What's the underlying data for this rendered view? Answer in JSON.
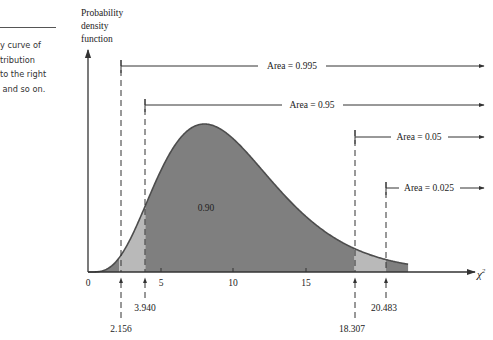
{
  "caption": {
    "lines": [
      "y curve of",
      "tribution",
      "to the right",
      " and so on."
    ]
  },
  "chart_data": {
    "type": "area",
    "title": "",
    "ylabel": "Probability density function",
    "xlabel": "χ²",
    "ylabel_lines": [
      "Probability",
      "density",
      "function"
    ],
    "xlabel_text": "χ",
    "xlabel_sup": "2",
    "x_ticks": [
      0,
      5,
      10,
      15
    ],
    "x_tick_labels": [
      "0",
      "5",
      "10",
      "15"
    ],
    "xlim": [
      0,
      22
    ],
    "distribution": "chi-square, df = 10 (approx.)",
    "critical_values": [
      {
        "value": 2.156,
        "label": "2.156",
        "area_right": 0.995,
        "area_label": "Area = 0.995"
      },
      {
        "value": 3.94,
        "label": "3.940",
        "area_right": 0.95,
        "area_label": "Area = 0.95"
      },
      {
        "value": 18.307,
        "label": "18.307",
        "area_right": 0.05,
        "area_label": "Area = 0.05"
      },
      {
        "value": 20.483,
        "label": "20.483",
        "area_right": 0.025,
        "area_label": "Area = 0.025"
      }
    ],
    "center_area_label": "0.90",
    "shading": {
      "dark": {
        "from": 3.94,
        "to": 18.307,
        "color": "#7f7f7f"
      },
      "light": [
        {
          "from": 2.156,
          "to": 3.94,
          "color": "#b9b9b9"
        },
        {
          "from": 18.307,
          "to": 20.483,
          "color": "#b9b9b9"
        }
      ],
      "tail_dark": [
        {
          "from": 0,
          "to": 2.156,
          "color": "#7f7f7f"
        },
        {
          "from": 20.483,
          "to": 22,
          "color": "#7f7f7f"
        }
      ]
    },
    "grid": false
  }
}
